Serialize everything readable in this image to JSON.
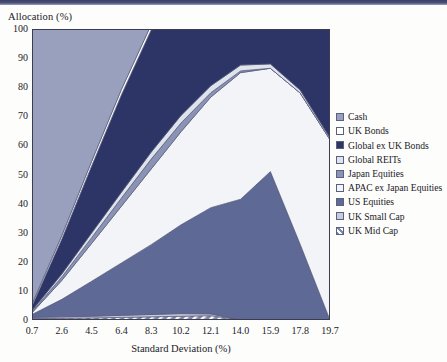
{
  "axes": {
    "y_title": "Allocation (%)",
    "x_title": "Standard Deviation (%)",
    "y_ticks": [
      "0",
      "10",
      "20",
      "30",
      "40",
      "50",
      "60",
      "70",
      "80",
      "90",
      "100"
    ],
    "x_ticks": [
      "0.7",
      "2.6",
      "4.5",
      "6.4",
      "8.3",
      "10.2",
      "12.1",
      "14.0",
      "15.9",
      "17.8",
      "19.7"
    ]
  },
  "legend": {
    "items": [
      {
        "label": "Cash",
        "color": "#98a0bd",
        "hatch": false
      },
      {
        "label": "UK Bonds",
        "color": "#ffffff",
        "hatch": false
      },
      {
        "label": "Global ex UK Bonds",
        "color": "#2c3566",
        "hatch": false
      },
      {
        "label": "Global REITs",
        "color": "#dfe3ec",
        "hatch": false
      },
      {
        "label": "Japan Equities",
        "color": "#8a93b3",
        "hatch": false
      },
      {
        "label": "APAC ex Japan Equities",
        "color": "#f2f4f8",
        "hatch": false
      },
      {
        "label": "US Equities",
        "color": "#5e6a95",
        "hatch": false
      },
      {
        "label": "UK Small Cap",
        "color": "#c7ccdc",
        "hatch": false
      },
      {
        "label": "UK Mid Cap",
        "color": "#6f7aa0",
        "hatch": true
      }
    ]
  },
  "chart_data": {
    "type": "area",
    "title": "",
    "xlabel": "Standard Deviation (%)",
    "ylabel": "Allocation (%)",
    "xlim": [
      0.7,
      19.7
    ],
    "ylim": [
      0,
      100
    ],
    "grid": false,
    "legend_position": "right",
    "stacking": "normal",
    "x": [
      0.7,
      2.6,
      4.5,
      6.4,
      8.3,
      10.2,
      12.1,
      14.0,
      15.9,
      17.8,
      19.7
    ],
    "series": [
      {
        "name": "UK Mid Cap",
        "values": [
          0.5,
          0.6,
          0.7,
          0.9,
          1.1,
          1.3,
          1.5,
          0.0,
          0.0,
          0.0,
          0.0
        ]
      },
      {
        "name": "UK Small Cap",
        "values": [
          0.4,
          0.5,
          0.6,
          0.7,
          0.8,
          0.9,
          0.6,
          0.0,
          0.0,
          0.0,
          0.0
        ]
      },
      {
        "name": "US Equities",
        "values": [
          1.0,
          6.0,
          12.0,
          18.0,
          24.0,
          30.5,
          36.5,
          41.5,
          51.0,
          26.0,
          0.0
        ]
      },
      {
        "name": "APAC ex Japan Equities",
        "values": [
          0.6,
          6.5,
          13.0,
          19.5,
          26.0,
          32.0,
          38.0,
          43.5,
          35.5,
          52.0,
          62.0
        ]
      },
      {
        "name": "Japan Equities",
        "values": [
          0.4,
          1.2,
          2.0,
          2.8,
          3.4,
          3.0,
          1.5,
          0.6,
          0.0,
          0.0,
          0.0
        ]
      },
      {
        "name": "Global REITs",
        "values": [
          0.4,
          1.0,
          1.6,
          2.0,
          2.4,
          2.6,
          2.4,
          2.0,
          1.5,
          1.0,
          0.6
        ]
      },
      {
        "name": "Global ex UK Bonds",
        "values": [
          1.5,
          12.0,
          23.0,
          33.5,
          42.0,
          30.5,
          20.0,
          12.4,
          12.0,
          21.0,
          37.4
        ]
      },
      {
        "name": "UK Bonds",
        "values": [
          0.7,
          1.2,
          1.6,
          1.8,
          1.8,
          0.0,
          0.0,
          0.0,
          0.0,
          0.0,
          0.0
        ]
      },
      {
        "name": "Cash",
        "values": [
          94.5,
          71.0,
          45.5,
          20.8,
          0.0,
          0.0,
          0.0,
          0.0,
          0.0,
          0.0,
          0.0
        ]
      }
    ]
  }
}
